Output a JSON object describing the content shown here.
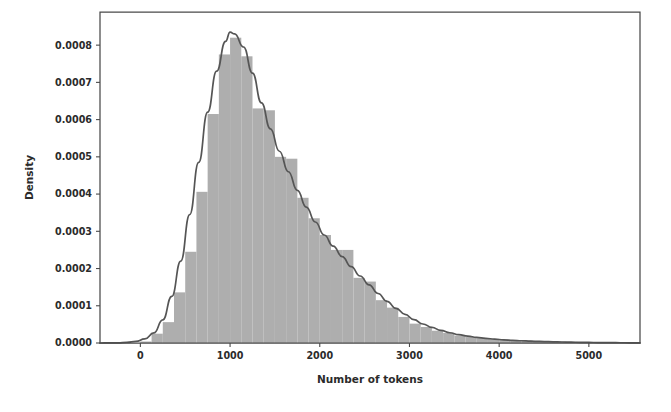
{
  "figure": {
    "background_color": "#ffffff",
    "width": 671,
    "height": 412
  },
  "axes": {
    "frame": {
      "left": 100,
      "top": 12,
      "right": 640,
      "bottom": 343
    },
    "spine_color": "#4a4a4a",
    "xlabel": "Number of tokens",
    "ylabel": "Density",
    "xticks": [
      0,
      1000,
      2000,
      3000,
      4000,
      5000
    ],
    "xtick_labels": [
      "0",
      "1000",
      "2000",
      "3000",
      "4000",
      "5000"
    ],
    "yticks": [
      0.0,
      0.0001,
      0.0002,
      0.0003,
      0.0004,
      0.0005,
      0.0006,
      0.0007,
      0.0008
    ],
    "ytick_labels": [
      "0.0000",
      "0.0001",
      "0.0002",
      "0.0003",
      "0.0004",
      "0.0005",
      "0.0006",
      "0.0007",
      "0.0008"
    ],
    "xlim": [
      -450,
      5570
    ],
    "ylim": [
      0.0,
      0.000889
    ]
  },
  "chart_data": {
    "type": "bar",
    "title": "",
    "xlabel": "Number of tokens",
    "ylabel": "Density",
    "xlim": [
      -450,
      5570
    ],
    "ylim": [
      0.0,
      0.000889
    ],
    "grid": false,
    "legend": null,
    "bar_color": "#aeaeae",
    "line_color": "#555555",
    "bin_width": 125,
    "series": [
      {
        "name": "Histogram of number of tokens",
        "type": "histogram",
        "bin_edges": [
          0,
          125,
          250,
          375,
          500,
          625,
          750,
          875,
          1000,
          1125,
          1250,
          1375,
          1500,
          1625,
          1750,
          1875,
          2000,
          2125,
          2250,
          2375,
          2500,
          2625,
          2750,
          2875,
          3000,
          3125,
          3250,
          3375,
          3500,
          3625,
          3750,
          3875,
          4000,
          4125,
          4250,
          4375,
          4500,
          4625,
          4750,
          4875,
          5000,
          5125,
          5250,
          5375,
          5500
        ],
        "bin_centers": [
          62,
          187,
          312,
          437,
          562,
          687,
          812,
          937,
          1062,
          1187,
          1312,
          1437,
          1562,
          1687,
          1812,
          1937,
          2062,
          2187,
          2312,
          2437,
          2562,
          2687,
          2812,
          2937,
          3062,
          3187,
          3312,
          3437,
          3562,
          3687,
          3812,
          3937,
          4062,
          4187,
          4312,
          4437,
          4562,
          4687,
          4812,
          4937,
          5062,
          5187,
          5312,
          5437
        ],
        "values": [
          4e-06,
          2.5e-05,
          5.6e-05,
          0.000136,
          0.000245,
          0.000406,
          0.000615,
          0.000775,
          0.00082,
          0.00077,
          0.00063,
          0.000625,
          0.0005,
          0.000495,
          0.00039,
          0.000335,
          0.00029,
          0.00025,
          0.00025,
          0.000175,
          0.000165,
          0.000115,
          9.5e-05,
          7e-05,
          5.2e-05,
          4.3e-05,
          3.3e-05,
          2.7e-05,
          2e-05,
          1.6e-05,
          1.3e-05,
          1.1e-05,
          9e-06,
          8e-06,
          6.5e-06,
          5.5e-06,
          4.5e-06,
          3.8e-06,
          3e-06,
          2.5e-06,
          2e-06,
          1.6e-06,
          1.2e-06,
          8e-07
        ]
      },
      {
        "name": "Kernel density estimate",
        "type": "line",
        "x": [
          -450,
          -350,
          -250,
          -150,
          -50,
          50,
          150,
          250,
          350,
          450,
          550,
          650,
          750,
          850,
          950,
          1000,
          1050,
          1150,
          1250,
          1350,
          1450,
          1550,
          1650,
          1750,
          1850,
          1950,
          2050,
          2150,
          2250,
          2350,
          2450,
          2550,
          2650,
          2750,
          2850,
          2950,
          3050,
          3150,
          3250,
          3350,
          3450,
          3550,
          3650,
          3750,
          3850,
          3950,
          4050,
          4150,
          4250,
          4350,
          4450,
          4550,
          4650,
          4750,
          4850,
          4950,
          5050,
          5150,
          5250,
          5350,
          5450,
          5570
        ],
        "y": [
          0.0,
          2e-07,
          6e-07,
          1.6e-06,
          4.2e-06,
          1.1e-05,
          2.7e-05,
          6.2e-05,
          0.000125,
          0.00022,
          0.000345,
          0.000485,
          0.00062,
          0.00073,
          0.00081,
          0.000835,
          0.00083,
          0.000795,
          0.000725,
          0.000645,
          0.000575,
          0.000515,
          0.00046,
          0.00041,
          0.000365,
          0.000325,
          0.00029,
          0.00026,
          0.000232,
          0.000205,
          0.00018,
          0.000156,
          0.000133,
          0.000112,
          9.3e-05,
          7.7e-05,
          6.3e-05,
          5.1e-05,
          4.2e-05,
          3.4e-05,
          2.75e-05,
          2.25e-05,
          1.85e-05,
          1.5e-05,
          1.25e-05,
          1.03e-05,
          8.6e-06,
          7.2e-06,
          6e-06,
          5e-06,
          4.2e-06,
          3.5e-06,
          2.9e-06,
          2.4e-06,
          2e-06,
          1.7e-06,
          1.4e-06,
          1.1e-06,
          9e-07,
          7e-07,
          5e-07,
          3e-07
        ]
      }
    ]
  }
}
